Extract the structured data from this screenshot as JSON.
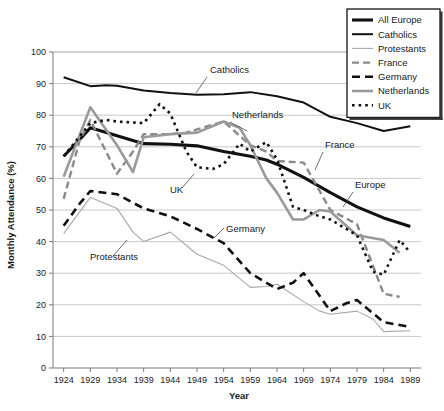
{
  "chart_data": {
    "type": "line",
    "title": "",
    "xlabel": "Year",
    "ylabel": "Monthly Attendance (%)",
    "xlim": [
      1922,
      1991
    ],
    "ylim": [
      0,
      100
    ],
    "ytick_step": 10,
    "grid": true,
    "legend_position": "top-right",
    "xticks": [
      "1924",
      "1929",
      "1934",
      "1939",
      "1944",
      "1949",
      "1954",
      "1959",
      "1964",
      "1969",
      "1974",
      "1979",
      "1984",
      "1989"
    ],
    "yticks": [
      "0",
      "10",
      "20",
      "30",
      "40",
      "50",
      "60",
      "70",
      "80",
      "90",
      "100"
    ],
    "series": [
      {
        "name": "All Europe",
        "style": "solid-thick-black",
        "color": "#111111",
        "x": [
          1924,
          1926,
          1929,
          1932,
          1934,
          1939,
          1944,
          1949,
          1954,
          1959,
          1962,
          1964,
          1969,
          1974,
          1979,
          1984,
          1989
        ],
        "values": [
          67,
          70.5,
          76,
          74.5,
          73.5,
          71,
          70.8,
          70.3,
          68.5,
          67,
          65.8,
          64.5,
          60.3,
          55.5,
          51,
          47.5,
          44.8
        ]
      },
      {
        "name": "Catholics",
        "style": "solid-black",
        "color": "#111111",
        "x": [
          1924,
          1929,
          1932,
          1934,
          1939,
          1944,
          1949,
          1954,
          1959,
          1964,
          1969,
          1974,
          1979,
          1984,
          1989
        ],
        "values": [
          92,
          89.2,
          89.5,
          89.3,
          87.8,
          87,
          86.5,
          86.6,
          87.3,
          86,
          84,
          79.5,
          77.5,
          75,
          76.5
        ]
      },
      {
        "name": "Protestants",
        "style": "solid-thin-gray",
        "color": "#a8a8a8",
        "x": [
          1924,
          1929,
          1934,
          1937,
          1939,
          1944,
          1949,
          1954,
          1959,
          1962,
          1964,
          1969,
          1972,
          1974,
          1979,
          1982,
          1984,
          1989
        ],
        "values": [
          42.5,
          54,
          50.5,
          43,
          40,
          43,
          36,
          32.5,
          25.5,
          25.8,
          26.5,
          21,
          18,
          17,
          18,
          15.5,
          11.5,
          11.8
        ]
      },
      {
        "name": "France",
        "style": "dash-gray",
        "color": "#8a8a8a",
        "x": [
          1924,
          1927,
          1929,
          1934,
          1937,
          1939,
          1944,
          1947,
          1949,
          1954,
          1959,
          1962,
          1964,
          1969,
          1974,
          1979,
          1984,
          1987
        ],
        "values": [
          53.5,
          72,
          78.5,
          61.5,
          68.5,
          74,
          74,
          74.5,
          75.5,
          78,
          70.5,
          68.5,
          65.5,
          65,
          50,
          45.5,
          23.5,
          22.5
        ]
      },
      {
        "name": "Germany",
        "style": "dash-black",
        "color": "#111111",
        "x": [
          1924,
          1927,
          1929,
          1934,
          1939,
          1944,
          1949,
          1954,
          1959,
          1964,
          1967,
          1969,
          1974,
          1977,
          1979,
          1984,
          1989
        ],
        "values": [
          45,
          52,
          56,
          55,
          50.5,
          48,
          44,
          39.5,
          30,
          25,
          27,
          30,
          18,
          20.5,
          21.5,
          14.5,
          13
        ]
      },
      {
        "name": "Netherlands",
        "style": "solid-thick-gray",
        "color": "#9a9a9a",
        "x": [
          1924,
          1929,
          1934,
          1937,
          1939,
          1944,
          1949,
          1954,
          1957,
          1959,
          1962,
          1964,
          1967,
          1969,
          1972,
          1974,
          1979,
          1984,
          1987
        ],
        "values": [
          60.5,
          82.5,
          70.5,
          62,
          73,
          74,
          74.5,
          78,
          76,
          70.5,
          60,
          55.5,
          47,
          47,
          50,
          49.5,
          42,
          40.5,
          36.5
        ]
      },
      {
        "name": "UK",
        "style": "dotted-black",
        "color": "#111111",
        "x": [
          1924,
          1929,
          1932,
          1934,
          1939,
          1942,
          1944,
          1947,
          1949,
          1952,
          1954,
          1957,
          1959,
          1962,
          1964,
          1967,
          1969,
          1972,
          1974,
          1977,
          1979,
          1982,
          1984,
          1987,
          1989
        ],
        "values": [
          67,
          77.5,
          78.5,
          78,
          77.5,
          83.5,
          80.5,
          68.5,
          63.5,
          63,
          64.5,
          71,
          68.5,
          71.5,
          66,
          51,
          50,
          48,
          47,
          44,
          42,
          30.5,
          29.5,
          40.5,
          36.5
        ]
      }
    ],
    "annotations": [
      {
        "label": "Catholics",
        "text_x": 210,
        "text_y": 73,
        "line_x1": 207,
        "line_y1": 77,
        "line_x2": 196,
        "line_y2": 93
      },
      {
        "label": "Netherlands",
        "text_x": 232,
        "text_y": 118,
        "line_x1": 230,
        "line_y1": 122,
        "line_x2": 247,
        "line_y2": 131
      },
      {
        "label": "France",
        "text_x": 325,
        "text_y": 148,
        "line_x1": 323,
        "line_y1": 152,
        "line_x2": 315,
        "line_y2": 170
      },
      {
        "label": "Europe",
        "text_x": 355,
        "text_y": 188,
        "line_x1": 353,
        "line_y1": 192,
        "line_x2": 343,
        "line_y2": 207
      },
      {
        "label": "UK",
        "text_x": 170,
        "text_y": 193,
        "line_x1": 182,
        "line_y1": 188,
        "line_x2": 194,
        "line_y2": 174
      },
      {
        "label": "Germany",
        "text_x": 226,
        "text_y": 232,
        "line_x1": 224,
        "line_y1": 228,
        "line_x2": 214,
        "line_y2": 238
      },
      {
        "label": "Protestants",
        "text_x": 90,
        "text_y": 260,
        "line_x1": 113,
        "line_y1": 256,
        "line_x2": 127,
        "line_y2": 240
      }
    ]
  },
  "legend": {
    "items": [
      {
        "label": "All Europe",
        "style": "solid-thick-black"
      },
      {
        "label": "Catholics",
        "style": "solid-black"
      },
      {
        "label": "Protestants",
        "style": "solid-thin-gray"
      },
      {
        "label": "France",
        "style": "dash-gray"
      },
      {
        "label": "Germany",
        "style": "dash-black"
      },
      {
        "label": "Netherlands",
        "style": "solid-thick-gray"
      },
      {
        "label": "UK",
        "style": "dotted-black"
      }
    ]
  }
}
